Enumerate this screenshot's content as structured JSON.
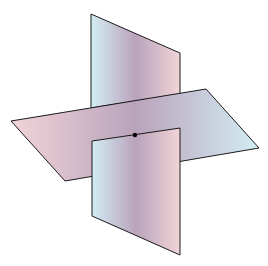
{
  "diagram": {
    "colors": {
      "background": "#ffffff",
      "edge": "#1a1a1a",
      "pink": "#f2d4d8",
      "mauve": "#b9a3bb",
      "lightblue": "#d3edf3",
      "point": "#000000"
    },
    "vertical_plane": {
      "top_left": [
        91,
        14
      ],
      "top_right": [
        180,
        53
      ],
      "bottom_right": [
        180,
        255
      ],
      "bottom_left": [
        92,
        216
      ]
    },
    "horizontal_plane": {
      "left": [
        11,
        121
      ],
      "top_right": [
        206,
        89
      ],
      "right": [
        259,
        148
      ],
      "bottom_left": [
        65,
        181
      ]
    },
    "intersection_point": [
      135,
      135
    ]
  }
}
